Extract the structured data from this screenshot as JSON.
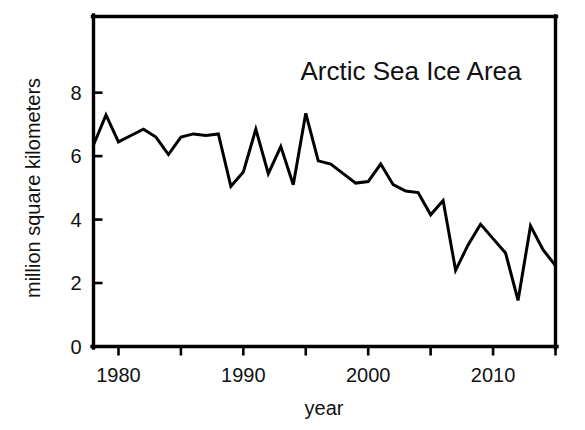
{
  "chart_data": {
    "type": "line",
    "title": "Arctic Sea Ice Area",
    "xlabel": "year",
    "ylabel": "million square kilometers",
    "xlim": [
      1978,
      2015
    ],
    "ylim": [
      0,
      10.4
    ],
    "grid": false,
    "legend": null,
    "y_ticks": [
      0,
      2,
      4,
      6,
      8
    ],
    "y_tick_labels": [
      "0",
      "2",
      "4",
      "6",
      "8"
    ],
    "x_ticks": [
      1980,
      1985,
      1990,
      1995,
      2000,
      2005,
      2010,
      2015
    ],
    "x_tick_labels": [
      "1980",
      "",
      "1990",
      "",
      "2000",
      "",
      "2010",
      ""
    ],
    "x_labeled_ticks": [
      1980,
      1990,
      2000,
      2010
    ],
    "series": [
      {
        "name": "Arctic Sea Ice Area",
        "color": "#000000",
        "x": [
          1978,
          1979,
          1980,
          1981,
          1982,
          1983,
          1984,
          1985,
          1986,
          1987,
          1988,
          1989,
          1990,
          1991,
          1992,
          1993,
          1994,
          1995,
          1996,
          1997,
          1998,
          1999,
          2000,
          2001,
          2002,
          2003,
          2004,
          2005,
          2006,
          2007,
          2008,
          2009,
          2010,
          2011,
          2012,
          2013,
          2014,
          2015
        ],
        "values": [
          6.35,
          7.3,
          6.45,
          6.65,
          6.85,
          6.6,
          6.05,
          6.6,
          6.7,
          6.65,
          6.7,
          5.05,
          5.5,
          6.85,
          5.45,
          6.3,
          5.1,
          7.35,
          5.85,
          5.75,
          5.45,
          5.15,
          5.2,
          5.75,
          5.1,
          4.9,
          4.85,
          4.15,
          4.6,
          2.4,
          3.2,
          3.85,
          3.4,
          2.95,
          1.45,
          3.8,
          3.05,
          2.55
        ]
      }
    ]
  },
  "title_annotation": {
    "text": "Arctic Sea Ice Area"
  },
  "axis_labels": {
    "x": "year",
    "y": "million square kilometers"
  }
}
